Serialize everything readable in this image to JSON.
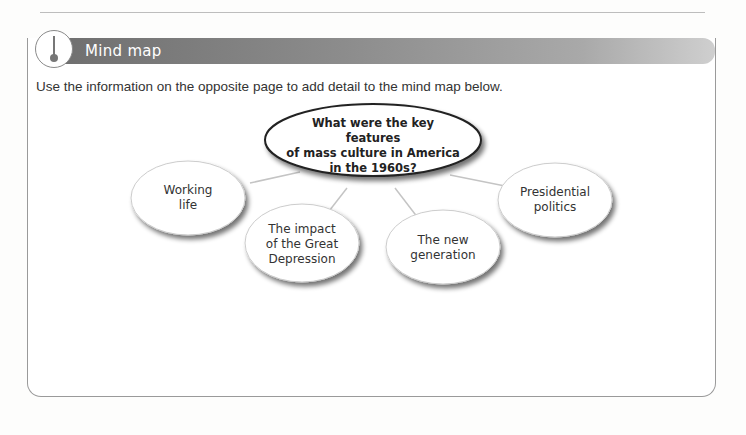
{
  "section": {
    "title": "Mind map",
    "icon": "thermometer-icon",
    "instruction": "Use the information on the opposite page to add detail to the mind map below."
  },
  "mind_map": {
    "central": {
      "line1": "What were the key features",
      "line2": "of mass culture in America",
      "line3": "in the 1960s?"
    },
    "branches": [
      {
        "line1": "Working",
        "line2": "life",
        "line3": ""
      },
      {
        "line1": "The impact",
        "line2": "of the Great",
        "line3": "Depression"
      },
      {
        "line1": "The new",
        "line2": "generation",
        "line3": ""
      },
      {
        "line1": "Presidential",
        "line2": "politics",
        "line3": ""
      }
    ]
  },
  "colors": {
    "header_dark": "#6f6f6f",
    "header_light": "#cfcfcf",
    "border": "#9a9a9a"
  }
}
